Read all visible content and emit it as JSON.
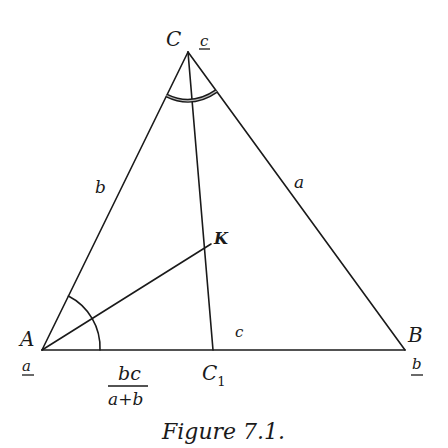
{
  "diagram": {
    "vertices": {
      "A": {
        "label": "A",
        "weight": "a"
      },
      "B": {
        "label": "B",
        "weight": "b"
      },
      "C": {
        "label": "C",
        "weight": "c"
      }
    },
    "points": {
      "K": {
        "label": "K"
      },
      "C1": {
        "label": "C",
        "subscript": "1"
      }
    },
    "sides": {
      "a": "a",
      "b": "b",
      "c": "c"
    },
    "segment_length": {
      "numerator": "bc",
      "denominator": "a+b"
    },
    "caption": "Figure 7.1.",
    "colors": {
      "ink": "#1a1a1a",
      "background": "#ffffff"
    }
  }
}
